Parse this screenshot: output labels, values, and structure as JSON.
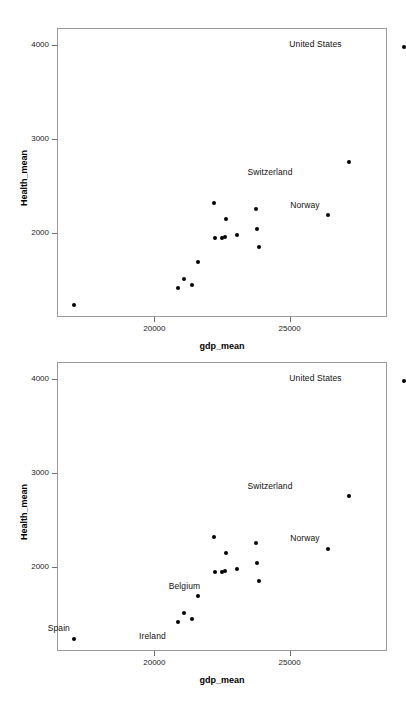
{
  "figure": {
    "width": 406,
    "height": 706,
    "background": "#ffffff",
    "marker_color": "#000000",
    "frame_color": "#9a9a9a",
    "panel_count": 2
  },
  "chart_data": [
    {
      "type": "scatter",
      "title": "",
      "xlabel": "gdp_mean",
      "ylabel": "Health_mean",
      "xticks": [
        20000,
        25000
      ],
      "xticklabels": [
        "20000",
        "25000"
      ],
      "yticks": [
        2000,
        3000,
        4000
      ],
      "yticklabels": [
        "2000",
        "3000",
        "4000"
      ],
      "xlim": [
        16400,
        28600
      ],
      "ylim": [
        1100,
        4180
      ],
      "grid": false,
      "legend": "none",
      "points": [
        {
          "label": "Spain",
          "x": 16990,
          "y": 1240,
          "annotated": false
        },
        {
          "label": "",
          "x": 20830,
          "y": 1417,
          "annotated": false
        },
        {
          "label": "",
          "x": 21070,
          "y": 1520,
          "annotated": false
        },
        {
          "label": "",
          "x": 21370,
          "y": 1457,
          "annotated": false
        },
        {
          "label": "",
          "x": 21570,
          "y": 1700,
          "annotated": false
        },
        {
          "label": "",
          "x": 22170,
          "y": 2330,
          "annotated": false
        },
        {
          "label": "",
          "x": 22200,
          "y": 1955,
          "annotated": false
        },
        {
          "label": "",
          "x": 22470,
          "y": 1955,
          "annotated": false
        },
        {
          "label": "",
          "x": 22580,
          "y": 1958,
          "annotated": false
        },
        {
          "label": "",
          "x": 22620,
          "y": 2150,
          "annotated": false
        },
        {
          "label": "",
          "x": 23020,
          "y": 1985,
          "annotated": false
        },
        {
          "label": "",
          "x": 23720,
          "y": 2265,
          "annotated": false
        },
        {
          "label": "",
          "x": 23740,
          "y": 2050,
          "annotated": false
        },
        {
          "label": "",
          "x": 23840,
          "y": 1862,
          "annotated": false
        },
        {
          "label": "Norway",
          "x": 26370,
          "y": 2200,
          "annotated": true
        },
        {
          "label": "Switzerland",
          "x": 27140,
          "y": 2760,
          "annotated": true
        },
        {
          "label": "United States",
          "x": 29180,
          "y": 3990,
          "annotated": true
        }
      ],
      "annotations": [
        {
          "text": "United States",
          "x": 29180,
          "y": 3990,
          "dx": -62,
          "dy": -3
        },
        {
          "text": "Switzerland",
          "x": 27140,
          "y": 2760,
          "dx": -56,
          "dy": 10
        },
        {
          "text": "Norway",
          "x": 26370,
          "y": 2200,
          "dx": -8,
          "dy": -10
        }
      ]
    },
    {
      "type": "scatter",
      "title": "",
      "xlabel": "gdp_mean",
      "ylabel": "Health_mean",
      "xticks": [
        20000,
        25000
      ],
      "xticklabels": [
        "20000",
        "25000"
      ],
      "yticks": [
        2000,
        3000,
        4000
      ],
      "yticklabels": [
        "2000",
        "3000",
        "4000"
      ],
      "xlim": [
        16400,
        28600
      ],
      "ylim": [
        1100,
        4180
      ],
      "grid": false,
      "legend": "none",
      "points": [
        {
          "label": "Spain",
          "x": 16990,
          "y": 1240,
          "annotated": true
        },
        {
          "label": "Ireland",
          "x": 20830,
          "y": 1417,
          "annotated": true
        },
        {
          "label": "",
          "x": 21070,
          "y": 1520,
          "annotated": false
        },
        {
          "label": "",
          "x": 21370,
          "y": 1457,
          "annotated": false
        },
        {
          "label": "",
          "x": 21570,
          "y": 1700,
          "annotated": false
        },
        {
          "label": "",
          "x": 22170,
          "y": 2330,
          "annotated": false
        },
        {
          "label": "",
          "x": 22200,
          "y": 1955,
          "annotated": false
        },
        {
          "label": "Belgium",
          "x": 22470,
          "y": 1955,
          "annotated": true
        },
        {
          "label": "",
          "x": 22580,
          "y": 1958,
          "annotated": false
        },
        {
          "label": "",
          "x": 22620,
          "y": 2150,
          "annotated": false
        },
        {
          "label": "",
          "x": 23020,
          "y": 1985,
          "annotated": false
        },
        {
          "label": "",
          "x": 23720,
          "y": 2265,
          "annotated": false
        },
        {
          "label": "",
          "x": 23740,
          "y": 2050,
          "annotated": false
        },
        {
          "label": "",
          "x": 23840,
          "y": 1862,
          "annotated": false
        },
        {
          "label": "Norway",
          "x": 26370,
          "y": 2200,
          "annotated": true
        },
        {
          "label": "Switzerland",
          "x": 27140,
          "y": 2760,
          "annotated": true
        },
        {
          "label": "United States",
          "x": 29180,
          "y": 3990,
          "annotated": true
        }
      ],
      "annotations": [
        {
          "text": "United States",
          "x": 29180,
          "y": 3990,
          "dx": -62,
          "dy": -3
        },
        {
          "text": "Switzerland",
          "x": 27140,
          "y": 2760,
          "dx": -56,
          "dy": -10
        },
        {
          "text": "Norway",
          "x": 26370,
          "y": 2200,
          "dx": -8,
          "dy": -11
        },
        {
          "text": "Belgium",
          "x": 22470,
          "y": 1955,
          "dx": -22,
          "dy": 14
        },
        {
          "text": "Ireland",
          "x": 20830,
          "y": 1417,
          "dx": -12,
          "dy": 14
        },
        {
          "text": "Spain",
          "x": 16990,
          "y": 1240,
          "dx": -4,
          "dy": -11
        }
      ]
    }
  ],
  "layout": {
    "panels": [
      {
        "frame": {
          "left": 57,
          "top": 28,
          "width": 330,
          "height": 289
        }
      },
      {
        "frame": {
          "left": 57,
          "top": 362,
          "width": 330,
          "height": 289
        }
      }
    ]
  }
}
